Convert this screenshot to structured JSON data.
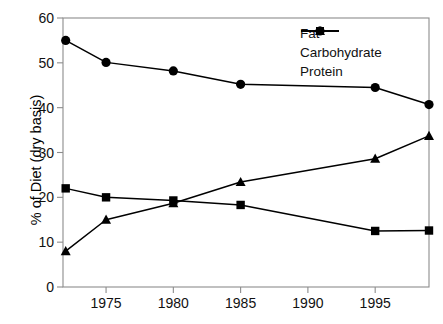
{
  "chart_data": {
    "type": "line",
    "title": "",
    "xlabel": "",
    "ylabel": "% of Diet (dry basis)",
    "xlim": [
      1971.8,
      1999.0
    ],
    "ylim": [
      0,
      60
    ],
    "grid": false,
    "legend_position": "top-right",
    "xticks": [
      1975,
      1980,
      1985,
      1990,
      1995
    ],
    "xtick_labels": [
      "1975",
      "1980",
      "1985",
      "1990",
      "1995"
    ],
    "yticks": [
      0,
      10,
      20,
      30,
      40,
      50,
      60
    ],
    "ytick_labels": [
      "0",
      "10",
      "20",
      "30",
      "40",
      "50",
      "60"
    ],
    "x": [
      1972,
      1975,
      1980,
      1985,
      1995,
      1999
    ],
    "series": [
      {
        "name": "Fat",
        "marker": "triangle",
        "color": "#000000",
        "values": [
          8.0,
          15.0,
          18.7,
          23.4,
          28.6,
          33.7
        ]
      },
      {
        "name": "Carbohydrate",
        "marker": "square",
        "color": "#000000",
        "values": [
          22.0,
          20.0,
          19.3,
          18.3,
          12.5,
          12.6
        ]
      },
      {
        "name": "Protein",
        "marker": "circle",
        "color": "#000000",
        "values": [
          55.0,
          50.1,
          48.2,
          45.2,
          44.5,
          40.7
        ]
      }
    ]
  },
  "legend": {
    "items": [
      {
        "label": "Fat",
        "marker": "triangle-marker-icon"
      },
      {
        "label": "Carbohydrate",
        "marker": "square-marker-icon"
      },
      {
        "label": "Protein",
        "marker": "circle-marker-icon"
      }
    ]
  },
  "axes": {
    "y_title": "% of Diet (dry basis)"
  },
  "colors": {
    "series_ink": "#000000",
    "frame": "#8c8c8c",
    "text": "#111111"
  }
}
